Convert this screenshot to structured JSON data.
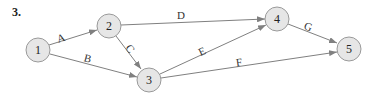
{
  "problem": {
    "number": "3."
  },
  "nodes": [
    {
      "id": "1",
      "label": "1",
      "x": 38,
      "y": 50
    },
    {
      "id": "2",
      "label": "2",
      "x": 109,
      "y": 26
    },
    {
      "id": "3",
      "label": "3",
      "x": 149,
      "y": 80
    },
    {
      "id": "4",
      "label": "4",
      "x": 277,
      "y": 19
    },
    {
      "id": "5",
      "label": "5",
      "x": 349,
      "y": 49
    }
  ],
  "edges": [
    {
      "label": "A",
      "from": "1",
      "to": "2"
    },
    {
      "label": "B",
      "from": "1",
      "to": "3"
    },
    {
      "label": "C",
      "from": "2",
      "to": "3"
    },
    {
      "label": "D",
      "from": "2",
      "to": "4"
    },
    {
      "label": "E",
      "from": "3",
      "to": "4"
    },
    {
      "label": "F",
      "from": "3",
      "to": "5"
    },
    {
      "label": "G",
      "from": "4",
      "to": "5"
    }
  ],
  "style": {
    "node_fill": "#e6e6e6",
    "node_stroke": "#9a9a9a",
    "edge_color": "#808080"
  }
}
